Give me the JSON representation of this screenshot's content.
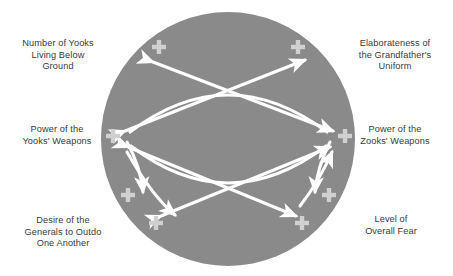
{
  "diagram": {
    "type": "causal-loop-diagram",
    "title": "",
    "circle": {
      "fill_color": "#8a8a8a",
      "center_x": 228,
      "center_y": 139,
      "radius": 127
    },
    "link_color": "#ffffff",
    "label_color": "#3b3b3b",
    "polarity_symbol": "+",
    "nodes": [
      {
        "id": "yooks-below-ground",
        "label": "Number of Yooks\nLiving Below\nGround",
        "position": "top-left"
      },
      {
        "id": "grandfather-uniform",
        "label": "Elaborateness of\nthe Grandfather's\nUniform",
        "position": "top-right"
      },
      {
        "id": "yooks-weapons",
        "label": "Power of the\nYooks' Weapons",
        "position": "middle-left"
      },
      {
        "id": "zooks-weapons",
        "label": "Power of the\nZooks' Weapons",
        "position": "middle-right"
      },
      {
        "id": "generals-desire",
        "label": "Desire of the\nGenerals to Outdo\nOne Another",
        "position": "bottom-left"
      },
      {
        "id": "overall-fear",
        "label": "Level of\nOverall Fear",
        "position": "bottom-right"
      }
    ],
    "links": [
      {
        "from": "yooks-weapons",
        "to": "grandfather-uniform",
        "polarity": "+",
        "style": "straight-double-arrow"
      },
      {
        "from": "zooks-weapons",
        "to": "yooks-below-ground",
        "polarity": "+",
        "style": "straight-double-arrow"
      },
      {
        "from": "yooks-below-ground",
        "to": "zooks-weapons",
        "polarity": "+",
        "style": "curved-arc"
      },
      {
        "from": "grandfather-uniform",
        "to": "yooks-weapons",
        "polarity": "+",
        "style": "curved-arc"
      },
      {
        "from": "yooks-weapons",
        "to": "overall-fear",
        "polarity": "+",
        "style": "straight-double-arrow"
      },
      {
        "from": "zooks-weapons",
        "to": "generals-desire",
        "polarity": "+",
        "style": "straight-double-arrow"
      },
      {
        "from": "yooks-weapons",
        "to": "generals-desire",
        "polarity": "+",
        "style": "curved-arc"
      },
      {
        "from": "zooks-weapons",
        "to": "overall-fear",
        "polarity": "+",
        "style": "curved-arc"
      },
      {
        "from": "generals-desire",
        "to": "zooks-weapons",
        "polarity": "+",
        "style": "curved-arc"
      },
      {
        "from": "overall-fear",
        "to": "yooks-weapons",
        "polarity": "+",
        "style": "curved-arc"
      }
    ],
    "polarity_markers": [
      {
        "id": "plus-top-left",
        "x": 159,
        "y": 54,
        "for_link": "yooks-below-ground"
      },
      {
        "id": "plus-top-right",
        "x": 298,
        "y": 54,
        "for_link": "grandfather-uniform"
      },
      {
        "id": "plus-middle-left",
        "x": 113,
        "y": 139,
        "for_link": "yooks-weapons"
      },
      {
        "id": "plus-middle-right",
        "x": 345,
        "y": 139,
        "for_link": "zooks-weapons"
      },
      {
        "id": "plus-lower-left-inner",
        "x": 128,
        "y": 195,
        "for_link": "yooks-weapons-down"
      },
      {
        "id": "plus-lower-right-inner",
        "x": 329,
        "y": 195,
        "for_link": "zooks-weapons-down"
      },
      {
        "id": "plus-bottom-left",
        "x": 156,
        "y": 223,
        "for_link": "generals-desire"
      },
      {
        "id": "plus-bottom-right",
        "x": 302,
        "y": 223,
        "for_link": "overall-fear"
      }
    ]
  }
}
